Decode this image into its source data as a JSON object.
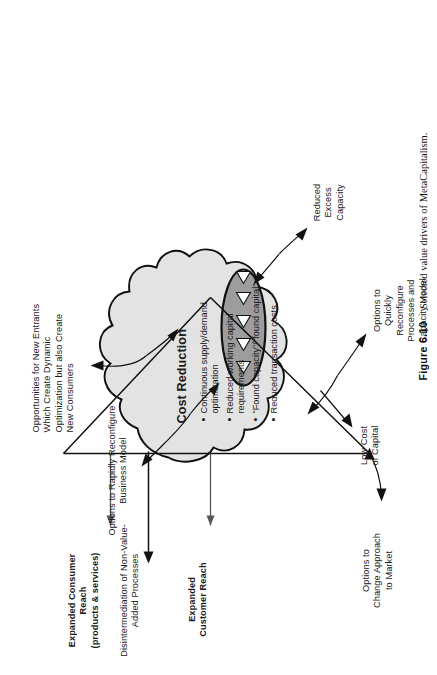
{
  "figure": {
    "number": "Figure 6.10",
    "caption": "Selected value drivers of MetaCapitalism."
  },
  "diagram": {
    "cluster_title": "Cost Reduction",
    "bullets": [
      "Continuous supply/demand optimization",
      "Reduced working capital requirements",
      "\"Found capacity\"/\"found capital\"",
      "Reduced transaction costs"
    ],
    "callouts": {
      "new_entrants": "Opportunities for New Entrants Which Create Dynamic Optimization but also Create New Consumers",
      "new_entrants_lines": [
        "Opportunities for New Entrants",
        "Which Create Dynamic",
        "Optimization but also Create",
        "New Consumers"
      ],
      "rapid_reconfigure_lines": [
        "Options to Rapidly Reconfigure",
        "Business Model"
      ],
      "disintermediation_lines": [
        "Disintermediation of Non-Value-",
        "Added Processes"
      ],
      "expanded_consumer_reach_lines": [
        "Expanded Consumer",
        "Reach",
        "(products & services)"
      ],
      "expanded_customer_reach_lines": [
        "Expanded",
        "Customer Reach"
      ],
      "change_approach_lines": [
        "Options to",
        "Change Approach",
        "to Market"
      ],
      "low_cost_capital_lines": [
        "Low Cost",
        "of Capital"
      ],
      "quickly_reconfigure_lines": [
        "Options to",
        "Quickly",
        "Reconfigure",
        "Processes and",
        "Capacity Model"
      ],
      "reduced_excess_capacity_lines": [
        "Reduced",
        "Excess",
        "Capacity"
      ]
    },
    "shapes": {
      "blob_fill": "#e3e3e3",
      "ellipse_fill": "#9d9d9d",
      "triangle_fill": "#ffffff",
      "stroke": "#111111",
      "triangle_count": 5
    }
  }
}
